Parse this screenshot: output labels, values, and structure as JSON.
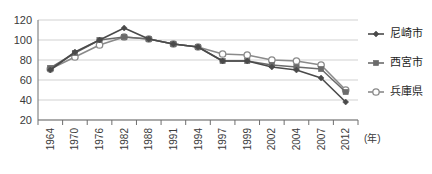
{
  "chart_data": {
    "type": "line",
    "title": "",
    "xlabel": "(年)",
    "ylabel": "",
    "ylim": [
      20,
      120
    ],
    "yticks": [
      20,
      40,
      60,
      80,
      100,
      120
    ],
    "grid": true,
    "legend_position": "right",
    "categories": [
      "1964",
      "1970",
      "1976",
      "1982",
      "1988",
      "1991",
      "1994",
      "1997",
      "1999",
      "2002",
      "2004",
      "2007",
      "2012"
    ],
    "series": [
      {
        "name": "尼崎市",
        "marker": "diamond",
        "color": "#4a4a4a",
        "values": [
          70,
          88,
          100,
          112,
          101,
          96,
          93,
          79,
          79,
          73,
          70,
          62,
          38
        ]
      },
      {
        "name": "西宮市",
        "marker": "square",
        "color": "#6b6b6b",
        "values": [
          72,
          87,
          100,
          103,
          101,
          96,
          93,
          79,
          79,
          75,
          73,
          71,
          48
        ]
      },
      {
        "name": "兵庫県",
        "marker": "circle-open",
        "color": "#8a8a8a",
        "values": [
          71,
          83,
          95,
          103,
          101,
          96,
          93,
          86,
          85,
          80,
          79,
          75,
          50
        ]
      }
    ]
  },
  "axis": {
    "unit_label": "(年)",
    "y_tick_labels": [
      "120",
      "100",
      "80",
      "60",
      "40",
      "20"
    ],
    "x_tick_labels": [
      "1964",
      "1970",
      "1976",
      "1982",
      "1988",
      "1991",
      "1994",
      "1997",
      "1999",
      "2002",
      "2004",
      "2007",
      "2012"
    ]
  },
  "legend": {
    "items": [
      {
        "label": "尼崎市",
        "marker": "diamond-marker"
      },
      {
        "label": "西宮市",
        "marker": "square-marker"
      },
      {
        "label": "兵庫県",
        "marker": "open-circle-marker"
      }
    ]
  },
  "colors": {
    "series_1": "#4a4a4a",
    "series_2": "#6b6b6b",
    "series_3": "#8a8a8a",
    "grid": "#bdbdbd",
    "axis": "#6e6e6e",
    "text": "#3a3a3a",
    "background": "#ffffff"
  }
}
